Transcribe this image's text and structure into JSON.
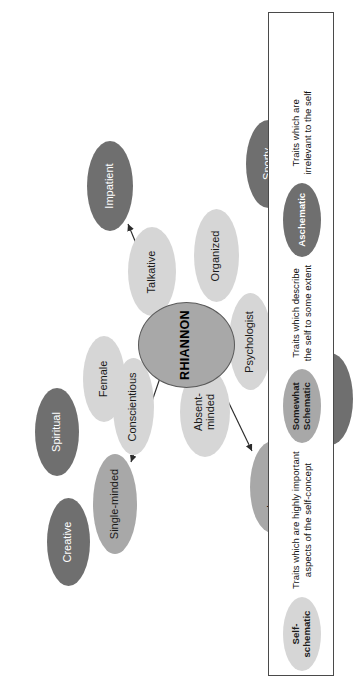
{
  "diagram": {
    "central_node": {
      "label": "RHIANNON",
      "category": "central",
      "color": "#a8a8a8"
    },
    "categories": {
      "self_schematic": {
        "key": "light",
        "color": "#d6d6d6"
      },
      "somewhat_schematic": {
        "key": "medium",
        "color": "#a8a8a8"
      },
      "aschematic": {
        "key": "dark",
        "color": "#6f6f6f"
      }
    },
    "nodes": [
      {
        "label": "Creative",
        "category": "aschematic"
      },
      {
        "label": "Spiritual",
        "category": "aschematic"
      },
      {
        "label": "Single-minded",
        "category": "somewhat_schematic"
      },
      {
        "label": "Conscientious",
        "category": "self_schematic"
      },
      {
        "label": "Female",
        "category": "self_schematic"
      },
      {
        "label": "Impatient",
        "category": "aschematic"
      },
      {
        "label": "Absent-\nminded",
        "category": "self_schematic"
      },
      {
        "label": "Talkative",
        "category": "self_schematic"
      },
      {
        "label": "Organized",
        "category": "self_schematic"
      },
      {
        "label": "Psychologist",
        "category": "self_schematic"
      },
      {
        "label": "Insecure",
        "category": "somewhat_schematic"
      },
      {
        "label": "Independent",
        "category": "somewhat_schematic"
      },
      {
        "label": "Sporty",
        "category": "aschematic"
      },
      {
        "label": "Musical",
        "category": "aschematic"
      }
    ],
    "arrows": [
      {
        "from": "RHIANNON",
        "to": "Single-minded"
      },
      {
        "from": "RHIANNON",
        "to": "Impatient"
      },
      {
        "from": "RHIANNON",
        "to": "Insecure"
      },
      {
        "from": "RHIANNON",
        "to": "Independent"
      }
    ]
  },
  "legend": {
    "entries": [
      {
        "chip_label": "Self-\nschematic",
        "category": "self_schematic",
        "description": "Traits which are highly important\naspects of the self-concept"
      },
      {
        "chip_label": "Somewhat\nSchematic",
        "category": "somewhat_schematic",
        "description": "Traits which describe\nthe self to some extent"
      },
      {
        "chip_label": "Aschematic",
        "category": "aschematic",
        "description": "Traits which are\nirrelevant to the self"
      }
    ]
  }
}
